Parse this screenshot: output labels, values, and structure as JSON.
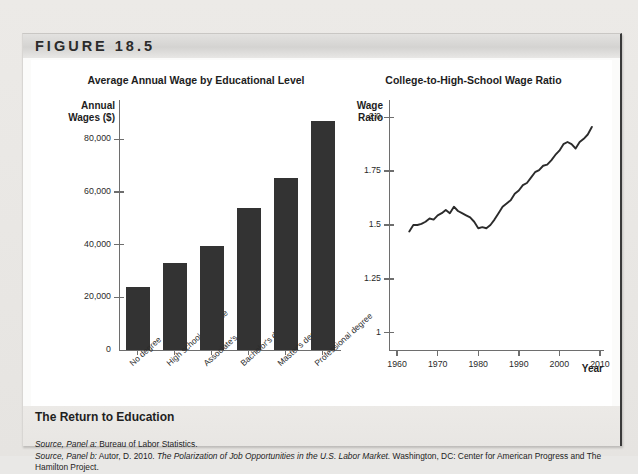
{
  "figure": {
    "label": "FIGURE 18.5",
    "caption_title": "The Return to Education",
    "sources": [
      {
        "prefix": "Source, Panel a:",
        "text": " Bureau of Labor Statistics."
      },
      {
        "prefix": "Source, Panel b:",
        "text": " Autor, D. 2010. ",
        "italic_title": "The Polarization of Job Opportunities in the U.S. Labor Market.",
        "tail": " Washington, DC: Center for American Progress and The Hamilton Project."
      }
    ]
  },
  "chart_data": [
    {
      "type": "bar",
      "panel": "a",
      "title": "Average Annual Wage by Educational Level",
      "ylabel_line1": "Annual",
      "ylabel_line2": "Wages ($)",
      "xlabel": "",
      "categories": [
        "No degree",
        "High school graduate",
        "Associate's degree",
        "Bachelor's degree",
        "Master's degree",
        "Professional degree"
      ],
      "values": [
        24000,
        33000,
        39500,
        54000,
        65500,
        87000
      ],
      "ytick_labels": [
        "0",
        "20,000",
        "40,000",
        "60,000",
        "80,000"
      ],
      "ytick_values": [
        0,
        20000,
        40000,
        60000,
        80000
      ],
      "ylim": [
        0,
        95000
      ],
      "bar_color": "#333333",
      "grid": false
    },
    {
      "type": "line",
      "panel": "b",
      "title": "College-to-High-School Wage Ratio",
      "ylabel_line1": "Wage",
      "ylabel_line2": "Ratio",
      "xlabel": "Year",
      "ytick_labels": [
        "1",
        "1.25",
        "1.5",
        "1.75",
        "2.0"
      ],
      "ytick_values": [
        1,
        1.25,
        1.5,
        1.75,
        2.0
      ],
      "ylim": [
        0.92,
        2.08
      ],
      "xtick_labels": [
        "1960",
        "1970",
        "1980",
        "1990",
        "2000",
        "2010"
      ],
      "xtick_values": [
        1960,
        1970,
        1980,
        1990,
        2000,
        2010
      ],
      "xlim": [
        1958,
        2011
      ],
      "line_color": "#2b2b2b",
      "grid": false,
      "x": [
        1963,
        1964,
        1965,
        1966,
        1967,
        1968,
        1969,
        1970,
        1971,
        1972,
        1973,
        1974,
        1975,
        1976,
        1977,
        1978,
        1979,
        1980,
        1981,
        1982,
        1983,
        1984,
        1985,
        1986,
        1987,
        1988,
        1989,
        1990,
        1991,
        1992,
        1993,
        1994,
        1995,
        1996,
        1997,
        1998,
        1999,
        2000,
        2001,
        2002,
        2003,
        2004,
        2005,
        2006,
        2007,
        2008
      ],
      "values": [
        1.47,
        1.5,
        1.5,
        1.505,
        1.515,
        1.53,
        1.525,
        1.545,
        1.555,
        1.57,
        1.555,
        1.585,
        1.565,
        1.555,
        1.545,
        1.535,
        1.515,
        1.485,
        1.49,
        1.485,
        1.5,
        1.525,
        1.555,
        1.585,
        1.6,
        1.615,
        1.645,
        1.66,
        1.685,
        1.695,
        1.72,
        1.745,
        1.755,
        1.775,
        1.78,
        1.8,
        1.825,
        1.845,
        1.875,
        1.885,
        1.875,
        1.855,
        1.885,
        1.9,
        1.92,
        1.955,
        1.97
      ]
    }
  ]
}
